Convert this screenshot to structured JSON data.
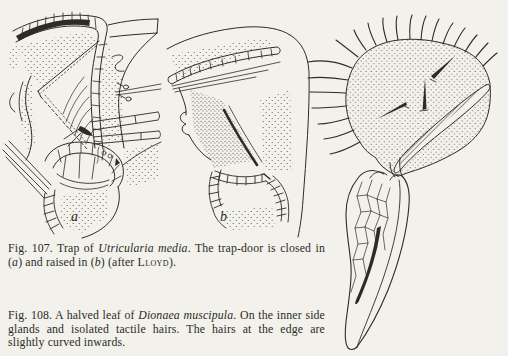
{
  "page": {
    "paper_color": "#f2f1ec",
    "ink_color": "#2c2b27"
  },
  "fig107": {
    "panel_a_label": "a",
    "panel_b_label": "b",
    "caption_segments": [
      {
        "text": "Fig. 107. Trap of ",
        "style": "plain"
      },
      {
        "text": "Utricularia media",
        "style": "italic"
      },
      {
        "text": ". The trap-door is closed in (",
        "style": "plain"
      },
      {
        "text": "a",
        "style": "italic"
      },
      {
        "text": ") and raised in (",
        "style": "plain"
      },
      {
        "text": "b",
        "style": "italic"
      },
      {
        "text": ") (after ",
        "style": "plain"
      },
      {
        "text": "Lloyd",
        "style": "smallcaps"
      },
      {
        "text": ").",
        "style": "plain"
      }
    ]
  },
  "fig108": {
    "caption_segments": [
      {
        "text": "Fig. 108. A halved leaf of ",
        "style": "plain"
      },
      {
        "text": "Dionaea muscipula",
        "style": "italic"
      },
      {
        "text": ". On the inner side glands and isolated tactile hairs. The hairs at the edge are slightly curved inwards.",
        "style": "plain"
      }
    ]
  }
}
